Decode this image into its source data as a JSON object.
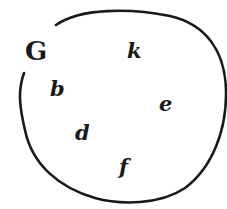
{
  "diagram": {
    "type": "set",
    "set_name": "G",
    "elements": [
      {
        "label": "k",
        "x": 127,
        "y": 40
      },
      {
        "label": "b",
        "x": 50,
        "y": 78
      },
      {
        "label": "e",
        "x": 158,
        "y": 95
      },
      {
        "label": "d",
        "x": 75,
        "y": 122
      },
      {
        "label": "f",
        "x": 119,
        "y": 156
      }
    ],
    "colors": {
      "stroke": "#1a1a1a",
      "background": "#ffffff"
    }
  }
}
